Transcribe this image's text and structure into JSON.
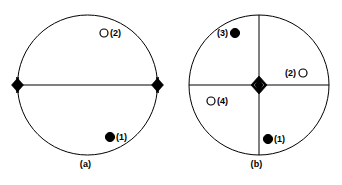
{
  "figure": {
    "background_color": "#ffffff",
    "stroke_color": "#000000",
    "panels": [
      {
        "id": "a",
        "caption": "(a)",
        "circle": {
          "cx": 87.5,
          "cy": 85,
          "r": 70
        },
        "lines": [
          {
            "name": "horizontal-axis",
            "x1": 17.5,
            "y1": 85,
            "x2": 157.5,
            "y2": 85
          }
        ],
        "center_marker": null,
        "edge_markers": [
          {
            "name": "left-edge-lens",
            "cx": 18,
            "cy": 85,
            "side": "right"
          },
          {
            "name": "right-edge-lens",
            "cx": 157,
            "cy": 85,
            "side": "left"
          }
        ],
        "points": [
          {
            "id": "2",
            "label": "(2)",
            "fill": "open",
            "cx": 104,
            "cy": 33,
            "label_x": 110,
            "label_y": 36,
            "label_anchor": "start"
          },
          {
            "id": "1",
            "label": "(1)",
            "fill": "solid",
            "cx": 110,
            "cy": 137,
            "label_x": 116,
            "label_y": 140,
            "label_anchor": "start"
          }
        ]
      },
      {
        "id": "b",
        "caption": "(b)",
        "circle": {
          "cx": 88,
          "cy": 85,
          "r": 70
        },
        "lines": [
          {
            "name": "horizontal-axis",
            "x1": 18,
            "y1": 85,
            "x2": 158,
            "y2": 85
          },
          {
            "name": "vertical-axis",
            "x1": 88,
            "y1": 15,
            "x2": 88,
            "y2": 155
          }
        ],
        "center_marker": {
          "name": "center-lens",
          "cx": 88,
          "cy": 85
        },
        "edge_markers": [],
        "points": [
          {
            "id": "3",
            "label": "(3)",
            "fill": "solid",
            "cx": 64,
            "cy": 33,
            "label_x": 57,
            "label_y": 36,
            "label_anchor": "end"
          },
          {
            "id": "2",
            "label": "(2)",
            "fill": "open",
            "cx": 132,
            "cy": 73,
            "label_x": 125,
            "label_y": 76,
            "label_anchor": "end"
          },
          {
            "id": "4",
            "label": "(4)",
            "fill": "open",
            "cx": 40,
            "cy": 101,
            "label_x": 46,
            "label_y": 104,
            "label_anchor": "start"
          },
          {
            "id": "1",
            "label": "(1)",
            "fill": "solid",
            "cx": 97,
            "cy": 139,
            "label_x": 103,
            "label_y": 142,
            "label_anchor": "start"
          }
        ]
      }
    ]
  }
}
